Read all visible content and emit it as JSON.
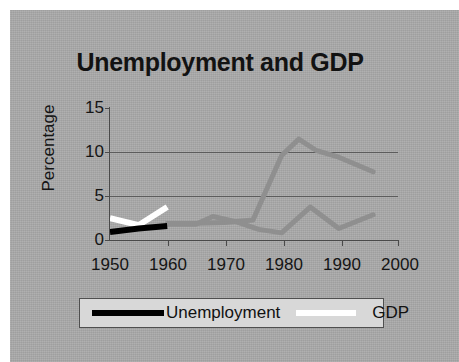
{
  "chart_data": {
    "type": "line",
    "title": "Unemployment and GDP",
    "xlabel": "",
    "ylabel": "Percentage",
    "xlim": [
      1950,
      2000
    ],
    "ylim": [
      0,
      15
    ],
    "yticks": [
      0,
      5,
      10,
      15
    ],
    "xticks": [
      1950,
      1960,
      1970,
      1980,
      1990,
      2000
    ],
    "xtick_labels": [
      "1950",
      "1960",
      "1970",
      "1980",
      "1990",
      "2000"
    ],
    "ytick_labels": [
      "0",
      "5",
      "10",
      "15"
    ],
    "grid": "horizontal",
    "legend_position": "bottom",
    "series": [
      {
        "name": "Unemployment",
        "color": "#000000",
        "x": [
          1950,
          1955,
          1960
        ],
        "values": [
          0.7,
          1.1,
          1.4
        ]
      },
      {
        "name": "GDP",
        "color": "#ffffff",
        "x": [
          1950,
          1955,
          1960
        ],
        "values": [
          2.3,
          1.5,
          3.6
        ]
      },
      {
        "name": "series-gray-upper",
        "color": "#8f8f8f",
        "x": [
          1960,
          1965,
          1970,
          1975,
          1980,
          1983,
          1986,
          1990,
          1996
        ],
        "values": [
          1.7,
          1.7,
          1.8,
          2.1,
          9.6,
          11.5,
          10.2,
          9.4,
          7.7
        ]
      },
      {
        "name": "series-gray-lower",
        "color": "#8f8f8f",
        "x": [
          1960,
          1965,
          1968,
          1972,
          1976,
          1980,
          1985,
          1990,
          1996
        ],
        "values": [
          1.6,
          1.6,
          2.5,
          1.9,
          1.0,
          0.6,
          3.6,
          1.1,
          2.7
        ]
      }
    ]
  },
  "legend": {
    "items": [
      {
        "label": "Unemployment",
        "color": "#000000"
      },
      {
        "label": "GDP",
        "color": "#ffffff"
      }
    ]
  },
  "colors": {
    "background": "#a9a9a9",
    "page": "#ffffff",
    "axis": "#4a4a4a",
    "grid": "#5c5c5c",
    "text": "#151515",
    "legend_background": "#d8d8d8"
  }
}
